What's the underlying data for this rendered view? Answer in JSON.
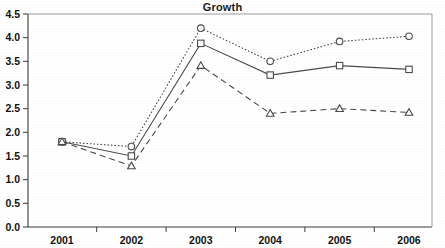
{
  "chart_data": {
    "type": "line",
    "title": "Growth",
    "xlabel": "",
    "ylabel": "",
    "categories": [
      "2001",
      "2002",
      "2003",
      "2004",
      "2005",
      "2006"
    ],
    "ylim": [
      0.0,
      4.5
    ],
    "ytick_labels": [
      "0.0",
      "0.5",
      "1.0",
      "1.5",
      "2.0",
      "2.5",
      "3.0",
      "3.5",
      "4.0",
      "4.5"
    ],
    "ytick_values": [
      0.0,
      0.5,
      1.0,
      1.5,
      2.0,
      2.5,
      3.0,
      3.5,
      4.0,
      4.5
    ],
    "grid": false,
    "legend": "none",
    "series": [
      {
        "name": "series-circle",
        "marker": "circle",
        "linestyle": "dotted",
        "color": "#4a4a4a",
        "values": [
          1.8,
          1.7,
          4.2,
          3.5,
          3.92,
          4.03
        ]
      },
      {
        "name": "series-square",
        "marker": "square",
        "linestyle": "solid",
        "color": "#4a4a4a",
        "values": [
          1.8,
          1.5,
          3.88,
          3.21,
          3.41,
          3.33
        ]
      },
      {
        "name": "series-triangle",
        "marker": "triangle",
        "linestyle": "dashed",
        "color": "#4a4a4a",
        "values": [
          1.8,
          1.29,
          3.41,
          2.4,
          2.5,
          2.42
        ]
      }
    ]
  }
}
